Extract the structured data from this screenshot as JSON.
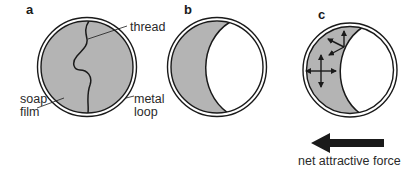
{
  "figure": {
    "panels": [
      {
        "id": "a",
        "letter": "a",
        "description": "soap film with thread spanning a metal loop"
      },
      {
        "id": "b",
        "letter": "b",
        "description": "film on one side broken; thread pulled into an arc"
      },
      {
        "id": "c",
        "letter": "c",
        "description": "force arrows on surface molecules of remaining film"
      }
    ],
    "labels": {
      "thread": "thread",
      "soap_film_line1": "soap",
      "soap_film_line2": "film",
      "metal_loop_line1": "metal",
      "metal_loop_line2": "loop",
      "net_force": "net attractive force"
    },
    "colors": {
      "film": "#b4b4b4",
      "outline": "#1a1a1a",
      "background": "#ffffff",
      "arrow": "#1a1a1a"
    },
    "icons": {
      "net_force_arrow": "left-arrow"
    }
  }
}
